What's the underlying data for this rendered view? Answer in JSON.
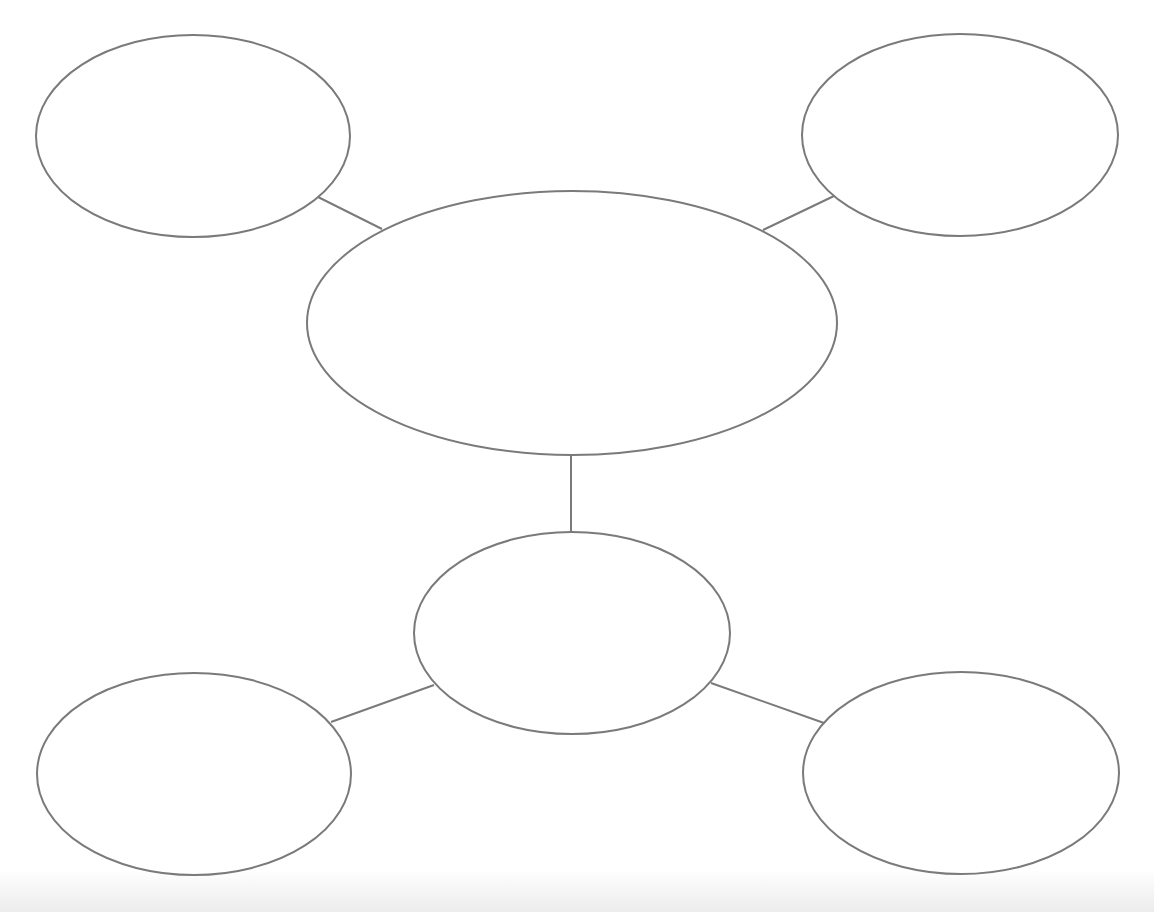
{
  "diagram": {
    "type": "bubble-map",
    "stroke_color": "#7a7a7a",
    "background_color": "#ffffff",
    "nodes": [
      {
        "id": "center",
        "label": "",
        "cx": 572,
        "cy": 323,
        "rx": 265,
        "ry": 132
      },
      {
        "id": "top-left",
        "label": "",
        "cx": 193,
        "cy": 136,
        "rx": 157,
        "ry": 101
      },
      {
        "id": "top-right",
        "label": "",
        "cx": 960,
        "cy": 135,
        "rx": 158,
        "ry": 101
      },
      {
        "id": "middle-bottom",
        "label": "",
        "cx": 572,
        "cy": 633,
        "rx": 158,
        "ry": 101
      },
      {
        "id": "bottom-left",
        "label": "",
        "cx": 194,
        "cy": 774,
        "rx": 157,
        "ry": 101
      },
      {
        "id": "bottom-right",
        "label": "",
        "cx": 961,
        "cy": 773,
        "rx": 158,
        "ry": 101
      }
    ],
    "edges": [
      {
        "from": "center",
        "to": "top-left",
        "x1": 382,
        "y1": 229,
        "x2": 318,
        "y2": 197
      },
      {
        "from": "center",
        "to": "top-right",
        "x1": 763,
        "y1": 230,
        "x2": 834,
        "y2": 196
      },
      {
        "from": "center",
        "to": "middle-bottom",
        "x1": 571,
        "y1": 455,
        "x2": 571,
        "y2": 532
      },
      {
        "from": "middle-bottom",
        "to": "bottom-left",
        "x1": 434,
        "y1": 685,
        "x2": 331,
        "y2": 722
      },
      {
        "from": "middle-bottom",
        "to": "bottom-right",
        "x1": 711,
        "y1": 683,
        "x2": 824,
        "y2": 723
      }
    ]
  }
}
